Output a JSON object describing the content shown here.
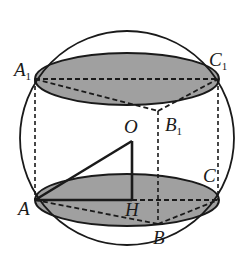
{
  "figure": {
    "colors": {
      "stroke": "#1a1a1a",
      "base_fill": "#8f8f8f",
      "background": "#ffffff"
    },
    "labels": {
      "A1": {
        "main": "A",
        "sub": "1"
      },
      "C1": {
        "main": "C",
        "sub": "1"
      },
      "B1": {
        "main": "B",
        "sub": "1"
      },
      "O": {
        "main": "O"
      },
      "A": {
        "main": "A"
      },
      "H": {
        "main": "H"
      },
      "C": {
        "main": "C"
      },
      "B": {
        "main": "B"
      }
    }
  }
}
